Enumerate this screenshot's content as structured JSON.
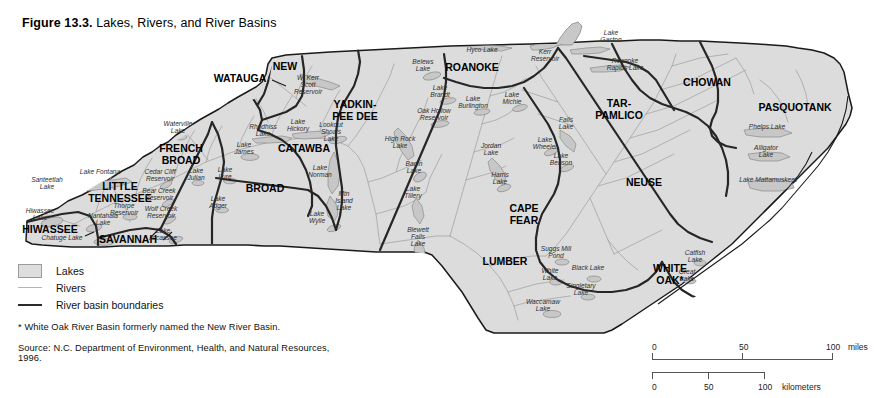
{
  "figure": {
    "number_label": "Figure 13.3.",
    "title": "Lakes, Rivers, and River Basins"
  },
  "legend": {
    "items": [
      {
        "key": "lakes-swatch",
        "label": "Lakes"
      },
      {
        "key": "rivers-line",
        "label": "Rivers"
      },
      {
        "key": "basin-boundary-line",
        "label": "River basin boundaries"
      }
    ],
    "footnote": "* White Oak River Basin formerly named the New River Basin.",
    "source": "Source: N.C. Department of Environment, Health, and Natural Resources, 1996."
  },
  "scale_bars": [
    {
      "unit": "miles",
      "ticks": [
        "0",
        "50",
        "100"
      ]
    },
    {
      "unit": "kilometers",
      "ticks": [
        "0",
        "50",
        "100"
      ]
    }
  ],
  "colors": {
    "land_fill": "#dcdcdc",
    "land_outline": "#1a1a1a",
    "basin_boundary": "#262626",
    "river": "#9e9e9e",
    "lake_fill": "#c8c8c8",
    "lake_outline": "#8a8a8a",
    "background": "#ffffff"
  },
  "map": {
    "basins": [
      {
        "name": "HIWASSEE",
        "x": 50,
        "y": 233,
        "size": 10.5,
        "lines": [
          "HIWASSEE"
        ]
      },
      {
        "name": "LITTLE TENNESSEE",
        "x": 120,
        "y": 190,
        "size": 10.5,
        "lines": [
          "LITTLE",
          "TENNESSEE"
        ]
      },
      {
        "name": "SAVANNAH",
        "x": 128,
        "y": 243,
        "size": 10.5,
        "lines": [
          "SAVANNAH"
        ]
      },
      {
        "name": "FRENCH BROAD",
        "x": 181,
        "y": 152,
        "size": 10.5,
        "lines": [
          "FRENCH",
          "BROAD"
        ]
      },
      {
        "name": "WATAUGA",
        "x": 240,
        "y": 82,
        "size": 10.5,
        "lines": [
          "WATAUGA"
        ]
      },
      {
        "name": "NEW",
        "x": 285,
        "y": 70,
        "size": 10.5,
        "lines": [
          "NEW"
        ]
      },
      {
        "name": "CATAWBA",
        "x": 304,
        "y": 152,
        "size": 10.5,
        "lines": [
          "CATAWBA"
        ]
      },
      {
        "name": "BROAD",
        "x": 265,
        "y": 192,
        "size": 10.5,
        "lines": [
          "BROAD"
        ]
      },
      {
        "name": "YADKIN-PEE DEE",
        "x": 355,
        "y": 108,
        "size": 10.5,
        "lines": [
          "YADKIN-",
          "PEE DEE"
        ]
      },
      {
        "name": "ROANOKE",
        "x": 472,
        "y": 71,
        "size": 10.5,
        "lines": [
          "ROANOKE"
        ]
      },
      {
        "name": "CAPE FEAR",
        "x": 524,
        "y": 212,
        "size": 10.5,
        "lines": [
          "CAPE",
          "FEAR"
        ]
      },
      {
        "name": "LUMBER",
        "x": 505,
        "y": 265,
        "size": 10.5,
        "lines": [
          "LUMBER"
        ]
      },
      {
        "name": "TAR-PAMLICO",
        "x": 619,
        "y": 107,
        "size": 10.5,
        "lines": [
          "TAR-",
          "PAMLICO"
        ]
      },
      {
        "name": "CHOWAN",
        "x": 707,
        "y": 86,
        "size": 10.5,
        "lines": [
          "CHOWAN"
        ]
      },
      {
        "name": "PASQUOTANK",
        "x": 795,
        "y": 111,
        "size": 10.5,
        "lines": [
          "PASQUOTANK"
        ]
      },
      {
        "name": "NEUSE",
        "x": 644,
        "y": 186,
        "size": 10.5,
        "lines": [
          "NEUSE"
        ]
      },
      {
        "name": "WHITE OAK",
        "x": 670,
        "y": 272,
        "size": 10.5,
        "lines": [
          "WHITE",
          "OAK*"
        ]
      }
    ],
    "lakes": [
      {
        "name": "Santeetlah Lake",
        "x": 47,
        "y": 182,
        "lines": [
          "Santeetlah",
          "Lake"
        ]
      },
      {
        "name": "Lake Fontana",
        "x": 100,
        "y": 174,
        "lines": [
          "Lake Fontana"
        ]
      },
      {
        "name": "Hiwassee Lake",
        "x": 40,
        "y": 213,
        "lines": [
          "Hiwassee",
          "Lake"
        ]
      },
      {
        "name": "Nantahala Lake",
        "x": 103,
        "y": 218,
        "lines": [
          "Nantahala",
          "Lake"
        ]
      },
      {
        "name": "Chatuge Lake",
        "x": 62,
        "y": 240,
        "lines": [
          "Chatuge  Lake"
        ]
      },
      {
        "name": "Thorpe Reservoir",
        "x": 124,
        "y": 208,
        "lines": [
          "Thorpe",
          "Reservoir"
        ]
      },
      {
        "name": "Cedar Cliff Reservoir",
        "x": 160,
        "y": 174,
        "lines": [
          "Cedar Cliff",
          "Reservoir"
        ]
      },
      {
        "name": "Bear Creek Reservoir",
        "x": 159,
        "y": 193,
        "lines": [
          "Bear Creek",
          "Reservoir"
        ]
      },
      {
        "name": "Wolf Creek Reservoir",
        "x": 161,
        "y": 211,
        "lines": [
          "Wolf Creek",
          "Reservoir"
        ]
      },
      {
        "name": "Waterville Lake",
        "x": 178,
        "y": 126,
        "lines": [
          "Waterville",
          "Lake"
        ]
      },
      {
        "name": "Lake Julian",
        "x": 196,
        "y": 173,
        "lines": [
          "Lake",
          "Julian"
        ]
      },
      {
        "name": "Lake Jocassee",
        "x": 163,
        "y": 233,
        "lines": [
          "Lake",
          "Jocassee"
        ]
      },
      {
        "name": "Lake Lure",
        "x": 225,
        "y": 172,
        "lines": [
          "Lake",
          "Lure"
        ]
      },
      {
        "name": "Lake Adger",
        "x": 218,
        "y": 201,
        "lines": [
          "Lake",
          "Adger"
        ]
      },
      {
        "name": "Lake James",
        "x": 244,
        "y": 147,
        "lines": [
          "Lake",
          "James"
        ]
      },
      {
        "name": "Rhodhiss Lake",
        "x": 263,
        "y": 129,
        "lines": [
          "Rhodhiss",
          "Lake"
        ]
      },
      {
        "name": "Lake Hickory",
        "x": 298,
        "y": 124,
        "lines": [
          "Lake",
          "Hickory"
        ]
      },
      {
        "name": "Lookout Shoals Lake",
        "x": 331,
        "y": 127,
        "lines": [
          "Lookout",
          "Shoals",
          "Lake"
        ]
      },
      {
        "name": "Lake Norman",
        "x": 320,
        "y": 170,
        "lines": [
          "Lake",
          "Norman"
        ]
      },
      {
        "name": "Mtn Island Lake",
        "x": 344,
        "y": 196,
        "lines": [
          "Mtn",
          "Island",
          "Lake"
        ]
      },
      {
        "name": "Lake Wylie",
        "x": 317,
        "y": 216,
        "lines": [
          "Lake",
          "Wylie"
        ]
      },
      {
        "name": "W. Kerr Scott Reservoir",
        "x": 308,
        "y": 80,
        "lines": [
          "W. Kerr",
          "Scott",
          "Reservoir"
        ]
      },
      {
        "name": "High Rock Lake",
        "x": 400,
        "y": 141,
        "lines": [
          "High Rock",
          "Lake"
        ]
      },
      {
        "name": "Badin Lake",
        "x": 414,
        "y": 166,
        "lines": [
          "Badin",
          "Lake"
        ]
      },
      {
        "name": "Lake Tillery",
        "x": 413,
        "y": 191,
        "lines": [
          "Lake",
          "Tillery"
        ]
      },
      {
        "name": "Blewett Falls Lake",
        "x": 418,
        "y": 232,
        "lines": [
          "Blewett",
          "Falls",
          "Lake"
        ]
      },
      {
        "name": "Belews Lake",
        "x": 423,
        "y": 64,
        "lines": [
          "Belews",
          "Lake"
        ]
      },
      {
        "name": "Hyco Lake",
        "x": 482,
        "y": 52,
        "lines": [
          "Hyco Lake"
        ]
      },
      {
        "name": "Lake Brandt",
        "x": 440,
        "y": 90,
        "lines": [
          "Lake",
          "Brandt"
        ]
      },
      {
        "name": "Oak Hollow Reservoir",
        "x": 434,
        "y": 113,
        "lines": [
          "Oak Hollow",
          "Reservoir"
        ]
      },
      {
        "name": "Lake Burlington",
        "x": 473,
        "y": 101,
        "lines": [
          "Lake",
          "Burlington"
        ]
      },
      {
        "name": "Lake Michie",
        "x": 512,
        "y": 97,
        "lines": [
          "Lake",
          "Michie"
        ]
      },
      {
        "name": "Kerr Reservoir",
        "x": 545,
        "y": 54,
        "lines": [
          "Kerr",
          "Reservoir"
        ]
      },
      {
        "name": "Lake Gaston",
        "x": 611,
        "y": 35,
        "lines": [
          "Lake",
          "Gaston"
        ]
      },
      {
        "name": "Roanoke Rapids Lake",
        "x": 625,
        "y": 63,
        "lines": [
          "Roanoke",
          "Rapids Lake"
        ]
      },
      {
        "name": "Falls Lake",
        "x": 566,
        "y": 122,
        "lines": [
          "Falls",
          "Lake"
        ]
      },
      {
        "name": "Jordan Lake",
        "x": 491,
        "y": 148,
        "lines": [
          "Jordan",
          "Lake"
        ]
      },
      {
        "name": "Harris Lake",
        "x": 500,
        "y": 177,
        "lines": [
          "Harris",
          "Lake"
        ]
      },
      {
        "name": "Lake Wheeler",
        "x": 545,
        "y": 142,
        "lines": [
          "Lake",
          "Wheeler"
        ]
      },
      {
        "name": "Lake Benson",
        "x": 561,
        "y": 158,
        "lines": [
          "Lake",
          "Benson"
        ]
      },
      {
        "name": "Phelps Lake",
        "x": 767,
        "y": 129,
        "lines": [
          "Phelps Lake"
        ]
      },
      {
        "name": "Alligator Lake",
        "x": 766,
        "y": 150,
        "lines": [
          "Alligator",
          "Lake"
        ]
      },
      {
        "name": "Lake Mattamuskeet",
        "x": 768,
        "y": 182,
        "lines": [
          "Lake Mattamuskeet"
        ]
      },
      {
        "name": "Catfish Lake",
        "x": 695,
        "y": 255,
        "lines": [
          "Catfish",
          "Lake"
        ]
      },
      {
        "name": "Great Lake",
        "x": 687,
        "y": 274,
        "lines": [
          "Great",
          "Lake"
        ]
      },
      {
        "name": "Suggs Mill Pond",
        "x": 556,
        "y": 251,
        "lines": [
          "Suggs Mill",
          "Pond"
        ]
      },
      {
        "name": "White Lake",
        "x": 550,
        "y": 273,
        "lines": [
          "White",
          "Lake"
        ]
      },
      {
        "name": "Black Lake",
        "x": 588,
        "y": 270,
        "lines": [
          "Black Lake"
        ]
      },
      {
        "name": "Singletary Lake",
        "x": 581,
        "y": 288,
        "lines": [
          "Singletary",
          "Lake"
        ]
      },
      {
        "name": "Waccamaw Lake",
        "x": 543,
        "y": 304,
        "lines": [
          "Waccamaw",
          "Lake"
        ]
      }
    ]
  }
}
